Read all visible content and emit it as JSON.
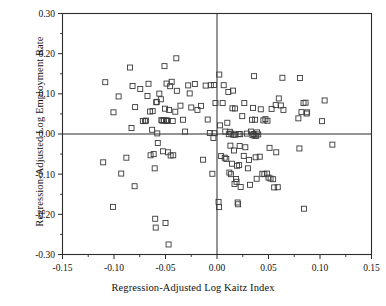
{
  "chart_data": {
    "type": "scatter",
    "title": "",
    "xlabel": "Regression-Adjusted Log Kaitz Index",
    "ylabel": "Regression-Adjusted Log Employment Rate",
    "xlim": [
      -0.15,
      0.15
    ],
    "ylim": [
      -0.3,
      0.3
    ],
    "xticks": [
      -0.15,
      -0.1,
      -0.05,
      0.0,
      0.05,
      0.1,
      0.15
    ],
    "xtick_labels": [
      "-0.15",
      "-0.10",
      "-0.05",
      "0.00",
      "0.05",
      "0.10",
      "0.15"
    ],
    "yticks": [
      0.3,
      0.2,
      0.1,
      0.0,
      -0.1,
      -0.2,
      -0.3
    ],
    "ytick_labels": [
      "0.30",
      "0.20",
      "0.10",
      "0.00",
      "-0.10",
      "-0.20",
      "-0.30"
    ],
    "x_minor_step": 0.025,
    "y_minor_step": 0.05,
    "grid": false,
    "legend": null,
    "marker": "open-square",
    "marker_color": "#3a3a3a",
    "reference_lines": {
      "x": 0.0,
      "y": 0.0
    },
    "points": [
      [
        -0.1085,
        0.129
      ],
      [
        -0.101,
        -0.1815
      ],
      [
        -0.1105,
        -0.0705
      ],
      [
        -0.1005,
        0.054
      ],
      [
        -0.0955,
        0.0935
      ],
      [
        -0.093,
        -0.0985
      ],
      [
        -0.088,
        -0.059
      ],
      [
        -0.0845,
        0.1655
      ],
      [
        -0.083,
        0.015
      ],
      [
        -0.082,
        0.1195
      ],
      [
        -0.0795,
        0.067
      ],
      [
        -0.08,
        -0.13
      ],
      [
        -0.0745,
        0.112
      ],
      [
        -0.072,
        0.0325
      ],
      [
        -0.07,
        0.032
      ],
      [
        -0.069,
        0.0335
      ],
      [
        -0.0675,
        0.0945
      ],
      [
        -0.0665,
        0.125
      ],
      [
        -0.065,
        0.056
      ],
      [
        -0.0645,
        -0.053
      ],
      [
        -0.063,
        0.0105
      ],
      [
        -0.0625,
        0.057
      ],
      [
        -0.0615,
        -0.05
      ],
      [
        -0.0605,
        -0.0855
      ],
      [
        -0.06,
        -0.211
      ],
      [
        -0.0595,
        -0.233
      ],
      [
        -0.059,
        0.079
      ],
      [
        -0.0585,
        0.08
      ],
      [
        -0.058,
        0.0015
      ],
      [
        -0.0575,
        -0.0225
      ],
      [
        -0.056,
        0.1005
      ],
      [
        -0.0545,
        0.0865
      ],
      [
        -0.054,
        0.0345
      ],
      [
        -0.053,
        0.033
      ],
      [
        -0.0525,
        -0.043
      ],
      [
        -0.0515,
        0.034
      ],
      [
        -0.051,
        0.169
      ],
      [
        -0.0505,
        0.063
      ],
      [
        -0.05,
        -0.2215
      ],
      [
        -0.0495,
        0.0335
      ],
      [
        -0.049,
        0.1255
      ],
      [
        -0.0485,
        0.0335
      ],
      [
        -0.048,
        0.033
      ],
      [
        -0.0475,
        -0.0455
      ],
      [
        -0.047,
        -0.275
      ],
      [
        -0.0465,
        0.06
      ],
      [
        -0.0455,
        0.119
      ],
      [
        -0.045,
        -0.0535
      ],
      [
        -0.044,
        0.13
      ],
      [
        -0.043,
        0.0325
      ],
      [
        -0.0425,
        -0.053
      ],
      [
        -0.0405,
        0.0555
      ],
      [
        -0.0395,
        0.1885
      ],
      [
        -0.039,
        0.1075
      ],
      [
        -0.0355,
        0.0705
      ],
      [
        -0.033,
        0.0355
      ],
      [
        -0.031,
        0.006
      ],
      [
        -0.028,
        0.121
      ],
      [
        -0.0265,
        0.101
      ],
      [
        -0.025,
        0.066
      ],
      [
        -0.0215,
        0.1245
      ],
      [
        -0.019,
        0.06
      ],
      [
        -0.0155,
        0.07
      ],
      [
        -0.0135,
        -0.064
      ],
      [
        -0.011,
        0.1205
      ],
      [
        -0.009,
        0.036
      ],
      [
        -0.007,
        0.0025
      ],
      [
        -0.006,
        0.1215
      ],
      [
        -0.0045,
        -0.099
      ],
      [
        -0.0035,
        -0.01
      ],
      [
        -0.003,
        0.122
      ],
      [
        -0.0025,
        0.002
      ],
      [
        -0.0015,
        0.077
      ],
      [
        0.0015,
        -0.169
      ],
      [
        0.002,
        -0.182
      ],
      [
        0.0022,
        0.148
      ],
      [
        0.003,
        0.0215
      ],
      [
        0.004,
        -0.055
      ],
      [
        0.0055,
        0.077
      ],
      [
        0.0065,
        0.1215
      ],
      [
        0.0075,
        -0.059
      ],
      [
        0.008,
        0.006
      ],
      [
        0.009,
        -0.062
      ],
      [
        0.01,
        0.028
      ],
      [
        0.011,
        0.1045
      ],
      [
        0.0115,
        -0.0005
      ],
      [
        0.012,
        -0.096
      ],
      [
        0.0125,
        0.0055
      ],
      [
        0.013,
        -0.029
      ],
      [
        0.0135,
        -0.1
      ],
      [
        0.014,
        0.001
      ],
      [
        0.0145,
        -0.074
      ],
      [
        0.015,
        0.064
      ],
      [
        0.0155,
        0.108
      ],
      [
        0.016,
        -0.002
      ],
      [
        0.0165,
        -0.041
      ],
      [
        0.017,
        -0.1245
      ],
      [
        0.0175,
        0.0635
      ],
      [
        0.018,
        -0.0015
      ],
      [
        0.0185,
        -0.112
      ],
      [
        0.019,
        -0.119
      ],
      [
        0.0195,
        -0.079
      ],
      [
        0.02,
        -0.1705
      ],
      [
        0.0205,
        -0.175
      ],
      [
        0.021,
        0.0
      ],
      [
        0.0215,
        -0.0775
      ],
      [
        0.022,
        -0.03
      ],
      [
        0.0225,
        -0.0005
      ],
      [
        0.023,
        -0.132
      ],
      [
        0.0245,
        0.0445
      ],
      [
        0.026,
        -0.0545
      ],
      [
        0.0265,
        0.077
      ],
      [
        0.0275,
        -0.033
      ],
      [
        0.029,
        0.001
      ],
      [
        0.03,
        -0.0855
      ],
      [
        0.031,
        -0.0645
      ],
      [
        0.032,
        -0.1265
      ],
      [
        0.033,
        0.006
      ],
      [
        0.034,
        0.0355
      ],
      [
        0.0345,
        -0.003
      ],
      [
        0.035,
        0.065
      ],
      [
        0.0355,
        0.0
      ],
      [
        0.036,
        0.144
      ],
      [
        0.0365,
        -0.004
      ],
      [
        0.037,
        0.0355
      ],
      [
        0.0375,
        -0.058
      ],
      [
        0.038,
        -0.0045
      ],
      [
        0.0385,
        -0.1115
      ],
      [
        0.039,
        0.004
      ],
      [
        0.04,
        -0.001
      ],
      [
        0.0415,
        -0.0565
      ],
      [
        0.0425,
        0.0615
      ],
      [
        0.044,
        -0.099
      ],
      [
        0.045,
        0.034
      ],
      [
        0.046,
        -0.1
      ],
      [
        0.047,
        0.037
      ],
      [
        0.0485,
        -0.0985
      ],
      [
        0.049,
        0.033
      ],
      [
        0.05,
        -0.1085
      ],
      [
        0.051,
        -0.0345
      ],
      [
        0.052,
        -0.111
      ],
      [
        0.053,
        0.0625
      ],
      [
        0.0545,
        -0.1125
      ],
      [
        0.0555,
        -0.133
      ],
      [
        0.057,
        0.072
      ],
      [
        0.0575,
        -0.0455
      ],
      [
        0.059,
        -0.1325
      ],
      [
        0.06,
        0.0885
      ],
      [
        0.062,
        0.071
      ],
      [
        0.0635,
        0.14
      ],
      [
        0.0645,
        0.06
      ],
      [
        0.079,
        0.039
      ],
      [
        0.08,
        -0.036
      ],
      [
        0.0805,
        0.1395
      ],
      [
        0.082,
        0.0545
      ],
      [
        0.084,
        0.077
      ],
      [
        0.0845,
        -0.186
      ],
      [
        0.086,
        0.078
      ],
      [
        0.087,
        0.051
      ],
      [
        0.0875,
        0.054
      ],
      [
        0.102,
        0.032
      ],
      [
        0.1045,
        0.0835
      ],
      [
        0.112,
        -0.0265
      ]
    ]
  },
  "axes": {
    "x_title": "Regression-Adjusted Log Kaitz Index",
    "y_title": "Regression-Adjusted Log Employment Rate"
  }
}
